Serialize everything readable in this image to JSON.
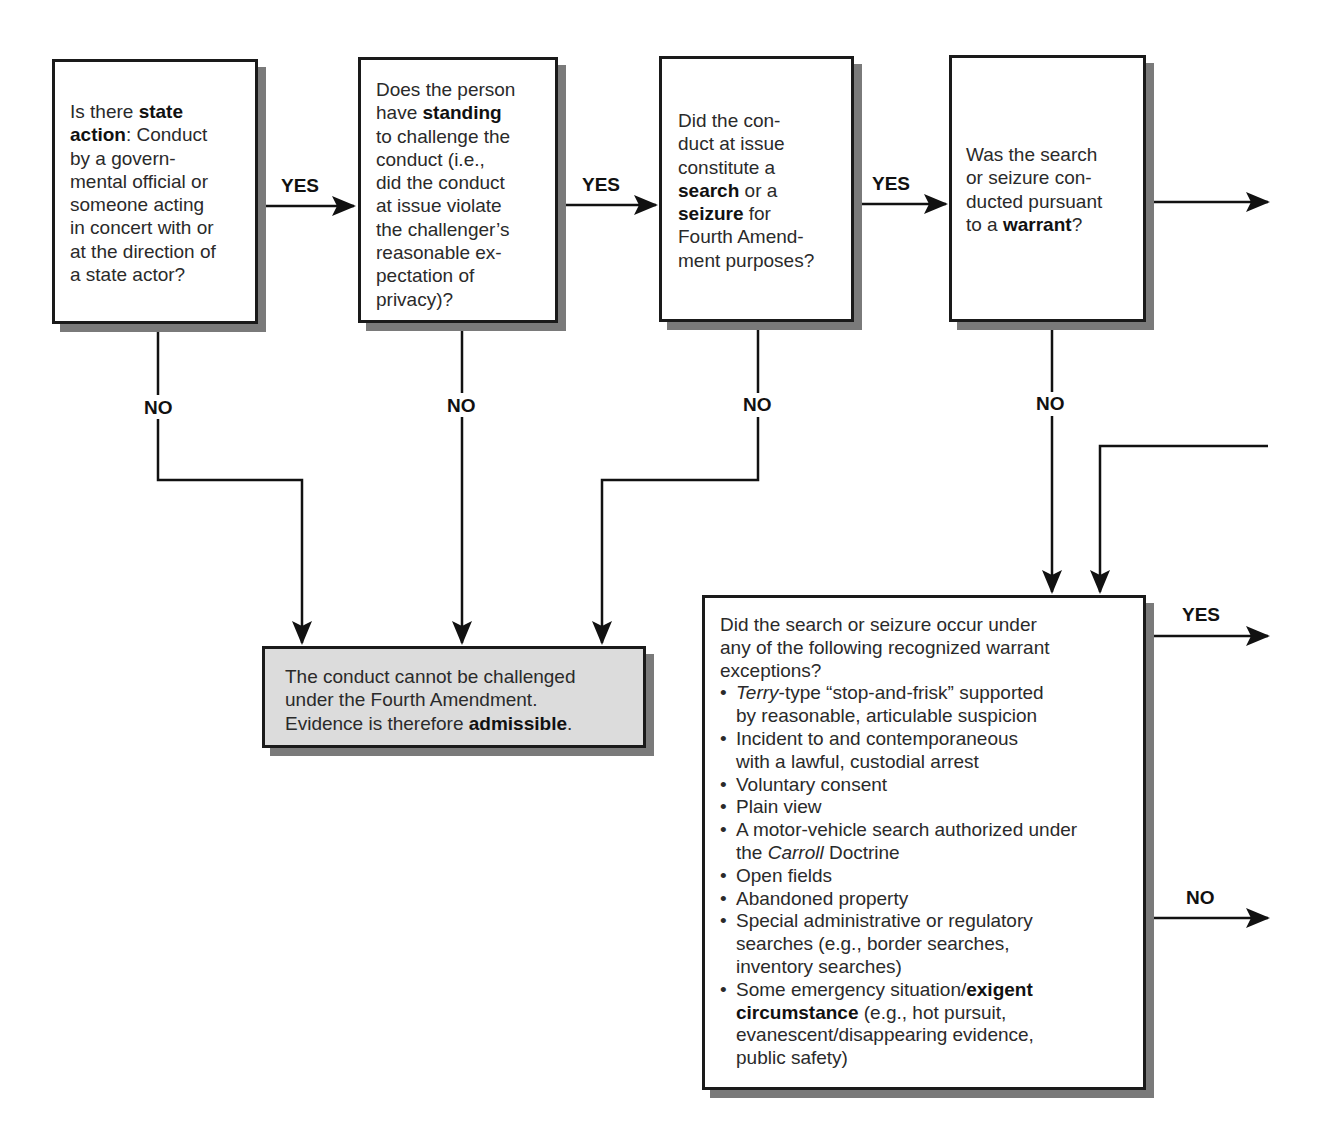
{
  "diagram": {
    "nodes": {
      "state_action": {
        "pre": "Is there ",
        "bold": "state action",
        "post": ": Conduct by a govern-mental official or someone acting in concert with or at the direction of a state actor?",
        "lines": [
          "Is there |state|",
          "|action|: Conduct",
          "by a govern-",
          "mental official or",
          "someone acting",
          "in concert with or",
          "at the direction of",
          "a state actor?"
        ]
      },
      "standing": {
        "lines": [
          "Does the person",
          "have |standing|",
          "to challenge the",
          "conduct (i.e.,",
          "did the conduct",
          "at issue violate",
          "the challenger’s",
          "reasonable ex-",
          "pectation of",
          "privacy)?"
        ]
      },
      "search_seizure": {
        "lines": [
          "Did the con-",
          "duct at issue",
          "constitute a",
          "|search| or a",
          "|seizure| for",
          "Fourth Amend-",
          "ment purposes?"
        ]
      },
      "warrant": {
        "lines": [
          "Was the search",
          "or seizure con-",
          "ducted pursuant",
          "to a |warrant|?"
        ]
      },
      "admissible": {
        "lines": [
          "The conduct cannot be challenged",
          "under the Fourth Amendment.",
          "Evidence is therefore |admissible|."
        ]
      },
      "exceptions": {
        "intro_lines": [
          "Did the search or seizure occur under",
          "any of the following recognized warrant",
          "exceptions?"
        ],
        "items": [
          {
            "lines": [
              "_Terry_-type “stop-and-frisk” supported",
              "by reasonable, articulable suspicion"
            ]
          },
          {
            "lines": [
              "Incident to and contemporaneous",
              "with a lawful, custodial arrest"
            ]
          },
          {
            "lines": [
              "Voluntary consent"
            ]
          },
          {
            "lines": [
              "Plain view"
            ]
          },
          {
            "lines": [
              "A motor-vehicle search authorized under",
              "the _Carroll_ Doctrine"
            ]
          },
          {
            "lines": [
              "Open fields"
            ]
          },
          {
            "lines": [
              "Abandoned property"
            ]
          },
          {
            "lines": [
              "Special administrative or regulatory",
              "searches (e.g., border searches,",
              "inventory searches)"
            ]
          },
          {
            "lines": [
              "Some emergency situation/|exigent|",
              "|circumstance| (e.g., hot pursuit,",
              "evanescent/disappearing evidence,",
              "public safety)"
            ]
          }
        ]
      }
    },
    "labels": {
      "yes": "YES",
      "no": "NO"
    },
    "colors": {
      "line": "#111111",
      "shadow": "#7a7a7a",
      "terminal_fill": "#dcdcdc"
    }
  }
}
